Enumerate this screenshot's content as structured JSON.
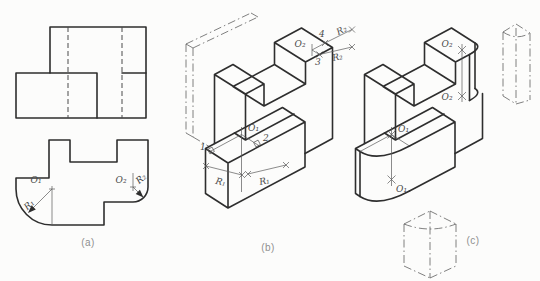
{
  "figure": {
    "colors": {
      "line": "#2e2e2e",
      "thin_line": "#5a5a5a",
      "caption": "#8f8f8f",
      "background": "#fcfcfb"
    },
    "panel_a": {
      "caption": "(a)",
      "center1": "O₁",
      "radius1": "R₁",
      "center2": "O₂",
      "radius2": "R₂"
    },
    "panel_b": {
      "caption": "(b)",
      "center1": "O₁",
      "center2": "O₂",
      "radius1a": "R₁",
      "radius1b": "R₁",
      "radius2a": "R₂",
      "radius2b": "R₂",
      "pt1": "1",
      "pt2": "2",
      "pt3": "3",
      "pt4": "4"
    },
    "panel_c": {
      "caption": "(c)",
      "center1_top": "O₁",
      "center1_bottom": "O₁",
      "center2_top": "O₂",
      "center2_bottom": "O₂"
    }
  }
}
